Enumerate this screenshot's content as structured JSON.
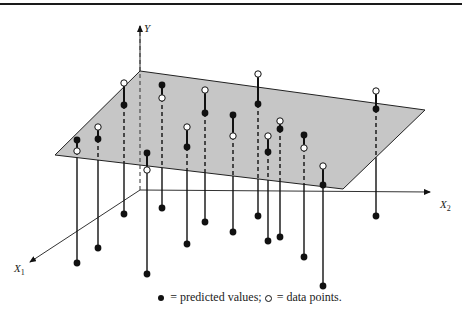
{
  "figure": {
    "axes": {
      "y_label": "Y",
      "x1_label": "X",
      "x1_sub": "1",
      "x2_label": "X",
      "x2_sub": "2"
    },
    "legend": {
      "predicted_text": "= predicted values;",
      "data_text": "= data points."
    },
    "colors": {
      "plane_fill": "#c6c6c6",
      "ink": "#111111",
      "background": "#ffffff"
    },
    "plane": [
      [
        140,
        71
      ],
      [
        425,
        110
      ],
      [
        343,
        189
      ],
      [
        55,
        155
      ]
    ],
    "stems": [
      {
        "x": 77,
        "open": 151,
        "pred": 140,
        "bottom": 263
      },
      {
        "x": 98,
        "open": 127,
        "pred": 139,
        "bottom": 248
      },
      {
        "x": 124,
        "open": 83,
        "pred": 105,
        "bottom": 214
      },
      {
        "x": 147,
        "open": 170,
        "pred": 153,
        "bottom": 274
      },
      {
        "x": 162,
        "open": 98,
        "pred": 85,
        "bottom": 208
      },
      {
        "x": 187,
        "open": 127,
        "pred": 147,
        "bottom": 244
      },
      {
        "x": 205,
        "open": 90,
        "pred": 113,
        "bottom": 222
      },
      {
        "x": 233,
        "open": 136,
        "pred": 115,
        "bottom": 232
      },
      {
        "x": 258,
        "open": 74,
        "pred": 104,
        "bottom": 216
      },
      {
        "x": 268,
        "open": 136,
        "pred": 152,
        "bottom": 241
      },
      {
        "x": 280,
        "open": 121,
        "pred": 129,
        "bottom": 237
      },
      {
        "x": 304,
        "open": 148,
        "pred": 135,
        "bottom": 257
      },
      {
        "x": 323,
        "open": 166,
        "pred": 185,
        "bottom": 286
      },
      {
        "x": 376,
        "open": 91,
        "pred": 109,
        "bottom": 216
      }
    ]
  }
}
